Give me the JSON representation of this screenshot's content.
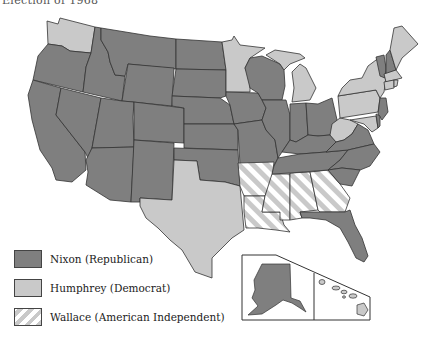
{
  "title": "Election of 1968",
  "colors": {
    "nixon": "#7f7f7f",
    "humphrey": "#c9c9c9",
    "wallace_stripe_a": "#c9c9c9",
    "wallace_stripe_b": "#ffffff",
    "border": "#333333"
  },
  "legend": [
    {
      "party": "nixon",
      "label": "Nixon (Republican)"
    },
    {
      "party": "humphrey",
      "label": "Humphrey (Democrat)"
    },
    {
      "party": "wallace",
      "label": "Wallace (American Independent)"
    }
  ],
  "states": {
    "nixon": [
      "Oregon",
      "California",
      "Idaho",
      "Nevada",
      "Montana",
      "Wyoming",
      "Utah",
      "Arizona",
      "Colorado",
      "New Mexico",
      "North Dakota",
      "South Dakota",
      "Nebraska",
      "Kansas",
      "Oklahoma",
      "Iowa",
      "Missouri",
      "Wisconsin",
      "Illinois",
      "Indiana",
      "Ohio",
      "Kentucky",
      "Tennessee",
      "Virginia",
      "North Carolina",
      "South Carolina",
      "Florida",
      "Vermont",
      "New Hampshire",
      "New Jersey",
      "Delaware",
      "Alaska"
    ],
    "humphrey": [
      "Washington",
      "Minnesota",
      "Texas",
      "Michigan",
      "Pennsylvania",
      "New York",
      "West Virginia",
      "Maine",
      "Massachusetts",
      "Rhode Island",
      "Connecticut",
      "Maryland",
      "Hawaii"
    ],
    "wallace": [
      "Arkansas",
      "Louisiana",
      "Mississippi",
      "Alabama",
      "Georgia"
    ]
  },
  "inset": {
    "alaska": "Alaska",
    "hawaii": "Hawaii"
  }
}
